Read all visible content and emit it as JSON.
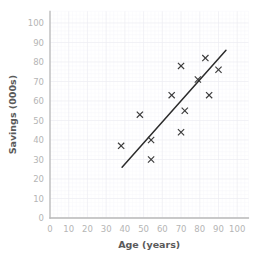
{
  "chart_data": {
    "type": "scatter",
    "title": "",
    "xlabel": "Age (years)",
    "ylabel": "Savings (000s)",
    "xlim": [
      0,
      106
    ],
    "ylim": [
      0,
      106
    ],
    "xticks": [
      0,
      10,
      20,
      30,
      40,
      50,
      60,
      70,
      80,
      90,
      100
    ],
    "yticks": [
      0,
      10,
      20,
      30,
      40,
      50,
      60,
      70,
      80,
      90,
      100
    ],
    "xtick_labels": [
      "0",
      "10",
      "20",
      "30",
      "40",
      "50",
      "60",
      "70",
      "80",
      "90",
      "100"
    ],
    "ytick_labels": [
      "0",
      "10",
      "20",
      "30",
      "40",
      "50",
      "60",
      "70",
      "80",
      "90",
      "100"
    ],
    "grid": true,
    "minor_grid": true,
    "legend": "none",
    "marker": "x",
    "marker_color": "#3a3a3a",
    "grid_color": "#ececf2",
    "axis_color": "#b8b8b8",
    "tick_label_color": "#b5b5b5",
    "axis_title_color": "#5a5a5a",
    "points": [
      {
        "x": 38,
        "y": 37
      },
      {
        "x": 48,
        "y": 53
      },
      {
        "x": 54,
        "y": 40
      },
      {
        "x": 54,
        "y": 30
      },
      {
        "x": 65,
        "y": 63
      },
      {
        "x": 70,
        "y": 44
      },
      {
        "x": 70,
        "y": 78
      },
      {
        "x": 72,
        "y": 55
      },
      {
        "x": 79,
        "y": 71
      },
      {
        "x": 83,
        "y": 82
      },
      {
        "x": 85,
        "y": 63
      },
      {
        "x": 90,
        "y": 76
      }
    ],
    "trendline": {
      "label": "line of best fit",
      "color": "#2b2b2b",
      "x0": 38.5,
      "y0": 26,
      "x1": 94,
      "y1": 86
    }
  }
}
